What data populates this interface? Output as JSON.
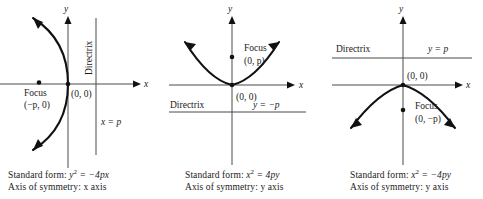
{
  "figure": {
    "background_color": "#ffffff",
    "curve_color": "#111111",
    "axis_color": "#4a4a4a",
    "text_color": "#1a1a1a"
  },
  "panels": [
    {
      "id": "panel-1",
      "orientation": "opens-left",
      "axis_labels": {
        "x": "x",
        "y": "y"
      },
      "vertex_label": "(0, 0)",
      "focus_label": "Focus",
      "focus_coords": "(−p, 0)",
      "directrix_label": "Directrix",
      "directrix_equation": "x = p",
      "directrix_type": "vertical",
      "caption": {
        "standard_form_prefix": "Standard form: ",
        "standard_form_base": "y",
        "standard_form_exponent": "2",
        "standard_form_rest": " = −4px",
        "axis_of_symmetry": "Axis of symmetry: x axis"
      }
    },
    {
      "id": "panel-2",
      "orientation": "opens-up",
      "axis_labels": {
        "x": "x",
        "y": "y"
      },
      "vertex_label": "(0, 0)",
      "focus_label": "Focus",
      "focus_coords": "(0, p)",
      "directrix_label": "Directrix",
      "directrix_equation": "y = −p",
      "directrix_type": "horizontal",
      "caption": {
        "standard_form_prefix": "Standard form: ",
        "standard_form_base": "x",
        "standard_form_exponent": "2",
        "standard_form_rest": " = 4py",
        "axis_of_symmetry": "Axis of symmetry: y axis"
      }
    },
    {
      "id": "panel-3",
      "orientation": "opens-down",
      "axis_labels": {
        "x": "x",
        "y": "y"
      },
      "vertex_label": "(0, 0)",
      "focus_label": "Focus",
      "focus_coords": "(0, −p)",
      "directrix_label": "Directrix",
      "directrix_equation": "y = p",
      "directrix_type": "horizontal",
      "caption": {
        "standard_form_prefix": "Standard form: ",
        "standard_form_base": "x",
        "standard_form_exponent": "2",
        "standard_form_rest": " = −4py",
        "axis_of_symmetry": "Axis of symmetry: y axis"
      }
    }
  ]
}
